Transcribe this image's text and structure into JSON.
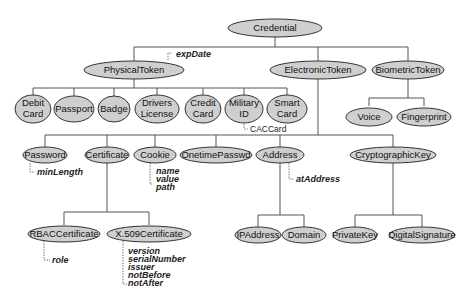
{
  "diagram": {
    "root": "Credential",
    "level1": [
      "PhysicalToken",
      "ElectronicToken",
      "BiometricToken"
    ],
    "physical_tokens": [
      {
        "line1": "Debit",
        "line2": "Card"
      },
      {
        "line1": "Passport",
        "line2": ""
      },
      {
        "line1": "Badge",
        "line2": ""
      },
      {
        "line1": "Drivers",
        "line2": "License"
      },
      {
        "line1": "Credit",
        "line2": "Card"
      },
      {
        "line1": "Military",
        "line2": "ID"
      },
      {
        "line1": "Smart",
        "line2": "Card"
      }
    ],
    "military_subtype": "CACCard",
    "physical_attr": "expDate",
    "biometric_tokens": [
      "Voice",
      "Fingerprint"
    ],
    "electronic_tokens": [
      "Password",
      "Certificate",
      "Cookie",
      "OnetimePasswd",
      "Address",
      "CryptographicKey"
    ],
    "password_attrs": [
      "minLength"
    ],
    "cookie_attrs": [
      "name",
      "value",
      "path"
    ],
    "address_attrs": [
      "atAddress"
    ],
    "certificates": [
      "RBACCertificate",
      "X.509Certificate"
    ],
    "rbac_attrs": [
      "role"
    ],
    "x509_attrs": [
      "version",
      "serialNumber",
      "issuer",
      "notBefore",
      "notAfter"
    ],
    "addresses": [
      "IPAddress",
      "Domain"
    ],
    "keys": [
      "PrivateKey",
      "DigitalSignature"
    ]
  }
}
